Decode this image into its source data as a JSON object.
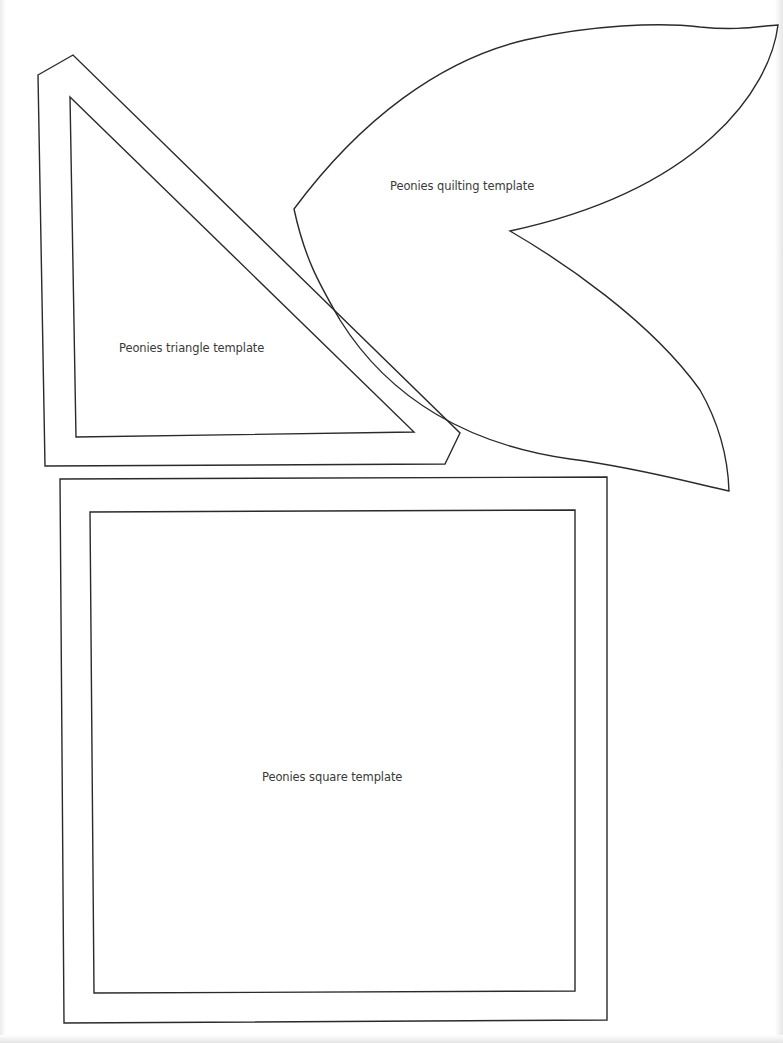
{
  "document": {
    "type": "printable quilting template sheet",
    "background_color": "#ffffff",
    "line_color": "#2a2a2a",
    "text_color": "#3a3a3a"
  },
  "templates": {
    "quilting": {
      "label": "Peonies quilting template",
      "shape": "petal"
    },
    "triangle": {
      "label": "Peonies triangle template",
      "shape": "right-triangle with seam allowance outline"
    },
    "square": {
      "label": "Peonies square template",
      "shape": "square with seam allowance outline"
    }
  }
}
